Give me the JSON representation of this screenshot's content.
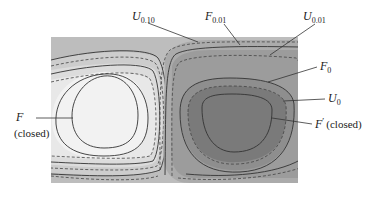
{
  "figure": {
    "type": "contour-diagram",
    "colors": {
      "background": "#ffffff",
      "field_outer": "#bdbdbd",
      "left_band_1": "#d2d2d2",
      "left_band_2": "#e4e4e4",
      "left_band_3": "#efefef",
      "left_core": "#ffffff",
      "right_band_1": "#a9a9a9",
      "right_band_2": "#989898",
      "right_band_3": "#868686",
      "right_core": "#5c5c5c",
      "contour_line": "#333333"
    },
    "line_styles": {
      "solid": "F contours",
      "dashed": "U contours"
    }
  },
  "labels": {
    "u010": {
      "main": "U",
      "sub": "0.10"
    },
    "f001": {
      "main": "F",
      "sub": "0.01"
    },
    "u001": {
      "main": "U",
      "sub": "0.01"
    },
    "f0": {
      "main": "F",
      "sub": "0"
    },
    "u0": {
      "main": "U",
      "sub": "0"
    },
    "fprime": {
      "main": "F",
      "prime": "′",
      "suffix": "(closed)"
    },
    "f_closed": {
      "main": "F",
      "suffix": "(closed)"
    }
  }
}
